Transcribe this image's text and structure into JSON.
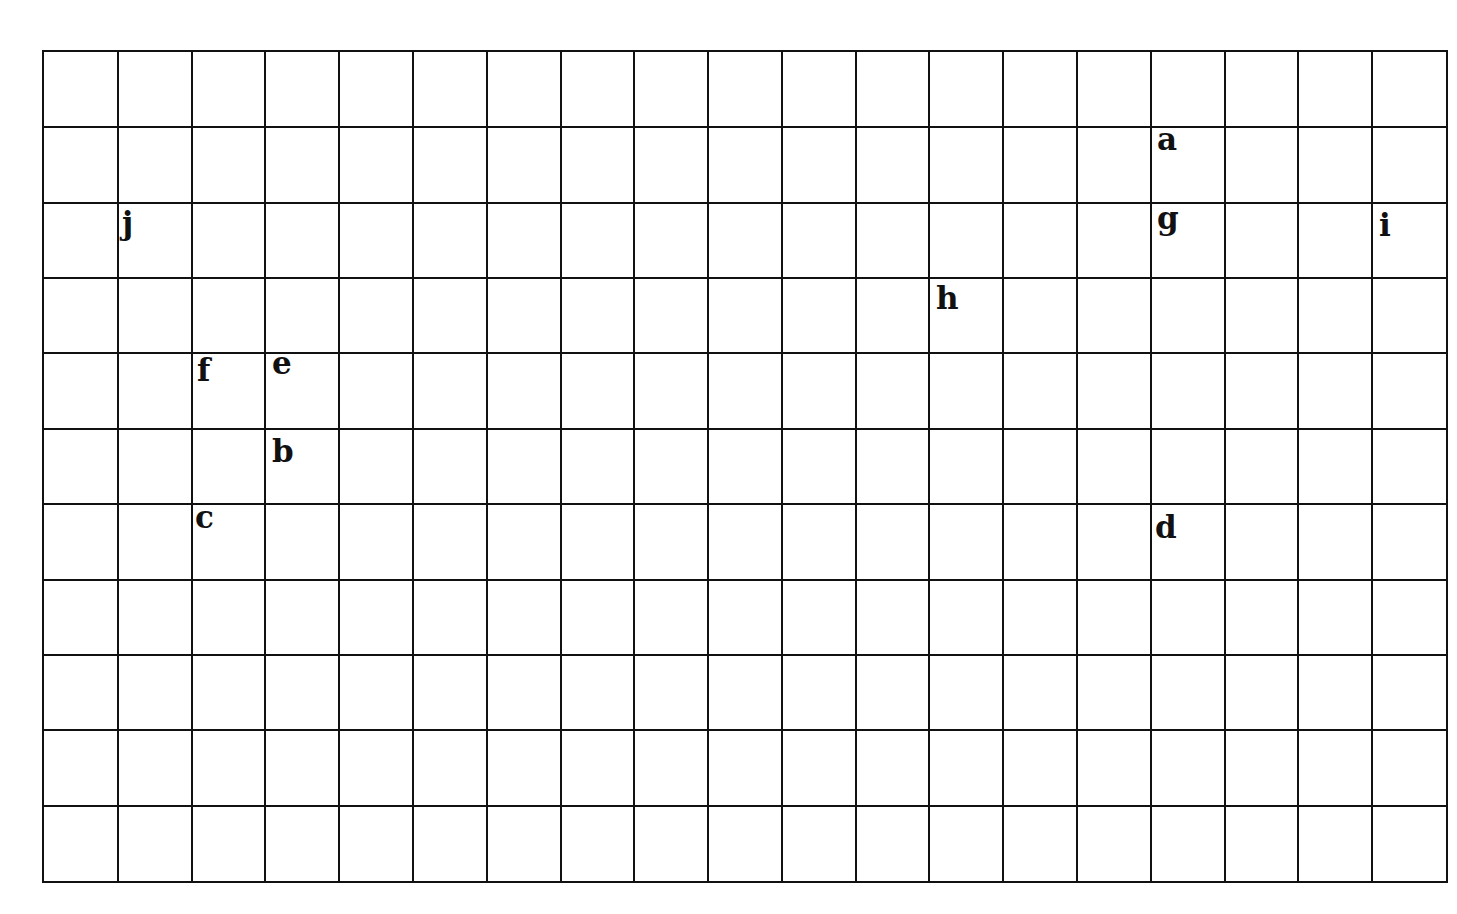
{
  "grid": {
    "columns": 19,
    "rows": 11,
    "line_color": "#111111",
    "background": "#ffffff"
  },
  "points": [
    {
      "label": "a",
      "col": 15,
      "row": 1
    },
    {
      "label": "b",
      "col": 3,
      "row": 5
    },
    {
      "label": "c",
      "col": 2,
      "row": 6
    },
    {
      "label": "d",
      "col": 15,
      "row": 6
    },
    {
      "label": "e",
      "col": 3,
      "row": 4
    },
    {
      "label": "f",
      "col": 2,
      "row": 4
    },
    {
      "label": "g",
      "col": 15,
      "row": 2
    },
    {
      "label": "h",
      "col": 12,
      "row": 3
    },
    {
      "label": "i",
      "col": 18,
      "row": 2
    },
    {
      "label": "j",
      "col": 1,
      "row": 2
    }
  ]
}
